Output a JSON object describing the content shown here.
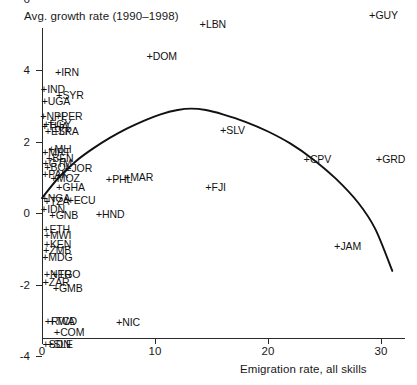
{
  "chart_data": {
    "type": "scatter",
    "title": "Avg. growth rate (1990–1998)",
    "ylabel": "Avg. growth rate (1990–1998)",
    "xlabel": "Emigration rate, all skills",
    "xlim": [
      -1.2,
      32
    ],
    "ylim": [
      -4.6,
      7.2
    ],
    "xticks": [
      0,
      10,
      20,
      30
    ],
    "xticklabels": [
      "0",
      "10",
      "20",
      "30"
    ],
    "yticks": [
      -4,
      -2,
      0,
      2,
      4,
      6
    ],
    "yticklabels": [
      "-4",
      "-2",
      "0",
      "2",
      "4",
      "6"
    ],
    "grid": false,
    "legend": null,
    "marker": "+",
    "points": [
      {
        "label": "CHN",
        "x": 0.3,
        "y": 6.85
      },
      {
        "label": "GUY",
        "x": 29.3,
        "y": 5.55
      },
      {
        "label": "LBN",
        "x": 14.3,
        "y": 5.28
      },
      {
        "label": "DOM",
        "x": 9.6,
        "y": 4.38
      },
      {
        "label": "IRN",
        "x": 1.5,
        "y": 3.95
      },
      {
        "label": "IND",
        "x": 0.25,
        "y": 3.48
      },
      {
        "label": "SYR",
        "x": 1.6,
        "y": 3.3
      },
      {
        "label": "UGA",
        "x": 0.3,
        "y": 3.12
      },
      {
        "label": "NPL",
        "x": 0.2,
        "y": 2.72
      },
      {
        "label": "PER",
        "x": 1.5,
        "y": 2.7
      },
      {
        "label": "EGY",
        "x": 0.45,
        "y": 2.48
      },
      {
        "label": "THA",
        "x": 0.3,
        "y": 2.44
      },
      {
        "label": "ESP",
        "x": 0.6,
        "y": 2.3
      },
      {
        "label": "LKA",
        "x": 1.3,
        "y": 2.28
      },
      {
        "label": "MLI",
        "x": 0.9,
        "y": 1.78
      },
      {
        "label": "MRT",
        "x": 0.35,
        "y": 1.72
      },
      {
        "label": "BEN",
        "x": 0.7,
        "y": 1.54
      },
      {
        "label": "GTM",
        "x": 0.4,
        "y": 1.4
      },
      {
        "label": "BOL",
        "x": 0.55,
        "y": 1.28
      },
      {
        "label": "JOR",
        "x": 2.4,
        "y": 1.26
      },
      {
        "label": "PAK",
        "x": 0.35,
        "y": 1.1
      },
      {
        "label": "MOZ",
        "x": 1.1,
        "y": 0.98
      },
      {
        "label": "PHL",
        "x": 6.0,
        "y": 0.94
      },
      {
        "label": "MAR",
        "x": 7.6,
        "y": 1.02
      },
      {
        "label": "GHA",
        "x": 1.6,
        "y": 0.72
      },
      {
        "label": "NGA",
        "x": 0.3,
        "y": 0.42
      },
      {
        "label": "TZA",
        "x": 0.5,
        "y": 0.34
      },
      {
        "label": "ECU",
        "x": 2.6,
        "y": 0.36
      },
      {
        "label": "IDN",
        "x": 0.25,
        "y": 0.1
      },
      {
        "label": "GNB",
        "x": 1.0,
        "y": -0.06
      },
      {
        "label": "HND",
        "x": 5.1,
        "y": -0.02
      },
      {
        "label": "ETH",
        "x": 0.45,
        "y": -0.44
      },
      {
        "label": "MWI",
        "x": 0.5,
        "y": -0.62
      },
      {
        "label": "KEN",
        "x": 0.5,
        "y": -0.88
      },
      {
        "label": "ZMB",
        "x": 0.45,
        "y": -1.04
      },
      {
        "label": "MDG",
        "x": 0.35,
        "y": -1.24
      },
      {
        "label": "NER",
        "x": 0.5,
        "y": -1.72
      },
      {
        "label": "TGO",
        "x": 1.2,
        "y": -1.7
      },
      {
        "label": "ZAR",
        "x": 0.4,
        "y": -1.94
      },
      {
        "label": "GMB",
        "x": 1.3,
        "y": -2.1
      },
      {
        "label": "RWA",
        "x": 0.6,
        "y": -3.02
      },
      {
        "label": "TCD",
        "x": 1.0,
        "y": -3.02
      },
      {
        "label": "NIC",
        "x": 6.9,
        "y": -3.06
      },
      {
        "label": "COM",
        "x": 1.4,
        "y": -3.34
      },
      {
        "label": "SDN",
        "x": 0.4,
        "y": -3.66
      },
      {
        "label": "SLE",
        "x": 0.8,
        "y": -3.66
      },
      {
        "label": "SLV",
        "x": 16.1,
        "y": 2.32
      },
      {
        "label": "CPV",
        "x": 23.5,
        "y": 1.52
      },
      {
        "label": "GRD",
        "x": 29.9,
        "y": 1.5
      },
      {
        "label": "FJI",
        "x": 14.8,
        "y": 0.72
      },
      {
        "label": "JAM",
        "x": 26.2,
        "y": -0.92
      }
    ],
    "fit_curve": {
      "description": "Nonparametric fitted curve of growth rate on emigration rate",
      "x": [
        0.0,
        1.5,
        3.0,
        4.5,
        6.0,
        7.5,
        9.0,
        10.5,
        12.0,
        13.2,
        14.5,
        16.0,
        18.0,
        20.0,
        22.0,
        24.0,
        26.0,
        28.0,
        29.5,
        31.0
      ],
      "y": [
        0.42,
        1.0,
        1.45,
        1.8,
        2.1,
        2.36,
        2.58,
        2.76,
        2.88,
        2.92,
        2.88,
        2.76,
        2.55,
        2.28,
        1.94,
        1.5,
        0.96,
        0.28,
        -0.45,
        -1.62
      ]
    }
  },
  "axes": {
    "y_title": "Avg. growth rate (1990–1998)",
    "x_title": "Emigration rate, all skills"
  }
}
